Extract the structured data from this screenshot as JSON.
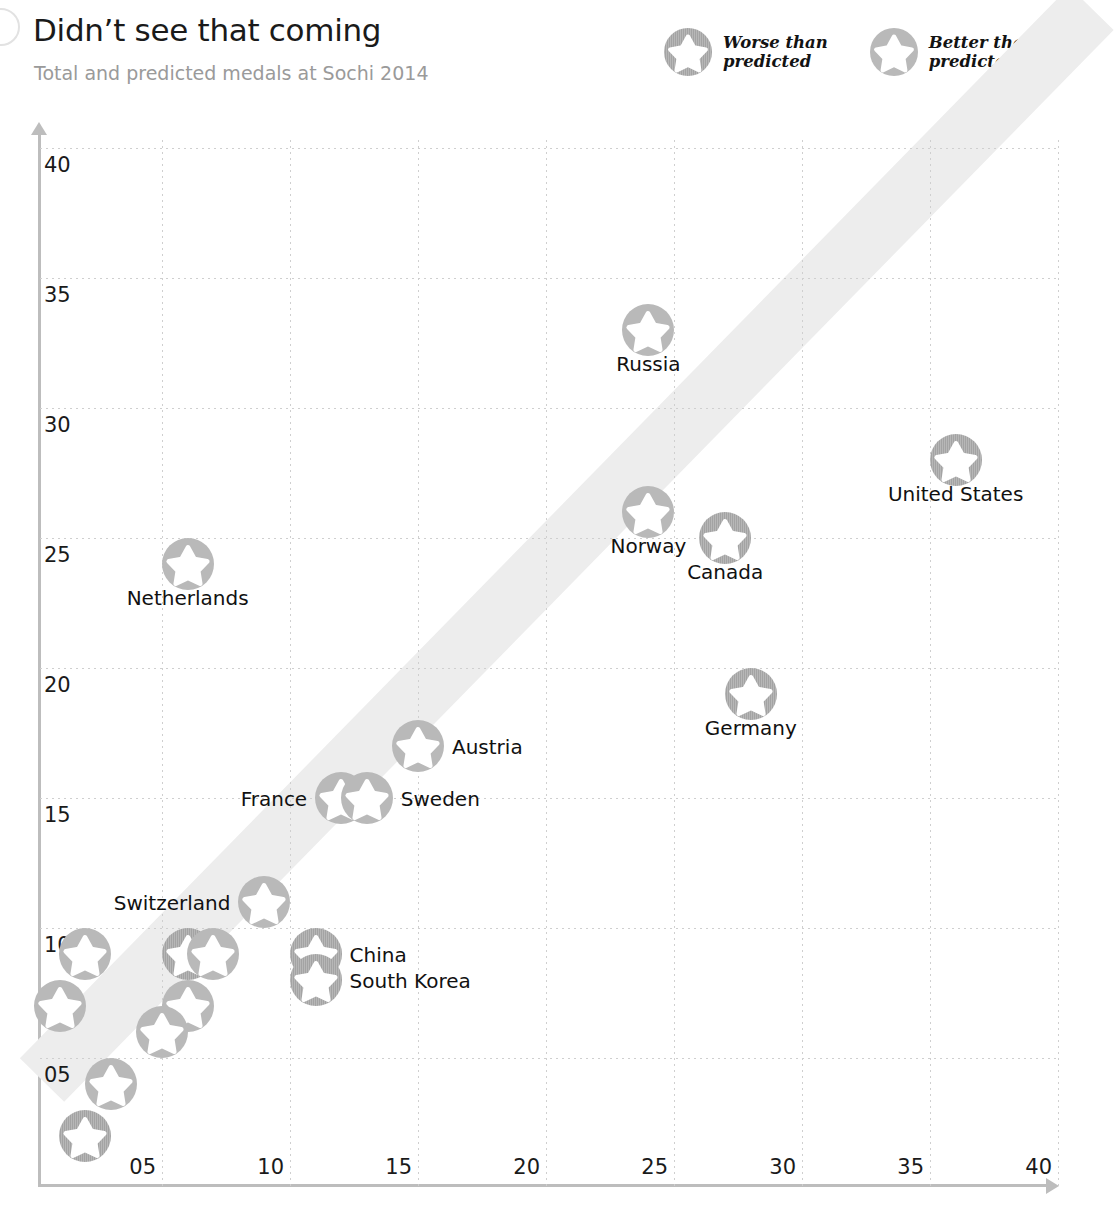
{
  "header": {
    "title": "Didn’t see that coming",
    "subtitle": "Total and predicted medals at Sochi 2014"
  },
  "legend": {
    "position": "top-right",
    "items": [
      {
        "label": "Worse than\npredicted",
        "style": "worse",
        "color": "#a3a3a3"
      },
      {
        "label": "Better than\npredicted",
        "style": "better",
        "color": "#b9b9b9"
      }
    ]
  },
  "colors": {
    "worse": "#a3a3a3",
    "better": "#b9b9b9",
    "band": "#ededed",
    "grid": "#cfcfcf",
    "axis": "#bdbdbd",
    "title": "#1a1a1a",
    "subtitle": "#9a9a9a"
  },
  "chart_data": {
    "type": "scatter",
    "title": "Didn’t see that coming",
    "subtitle": "Total and predicted medals at Sochi 2014",
    "xlabel": "",
    "ylabel": "",
    "xlim": [
      0,
      40
    ],
    "ylim": [
      0,
      41
    ],
    "grid": true,
    "xticks": [
      "05",
      "10",
      "15",
      "20",
      "25",
      "30",
      "35",
      "40"
    ],
    "xtick_values": [
      5,
      10,
      15,
      20,
      25,
      30,
      35,
      40
    ],
    "yticks": [
      "05",
      "10",
      "15",
      "20",
      "25",
      "30",
      "35",
      "40"
    ],
    "ytick_values": [
      5,
      10,
      15,
      20,
      25,
      30,
      35,
      40
    ],
    "parity_band": {
      "note": "diagonal equal-prediction band",
      "width_units": 2.4
    },
    "points": [
      {
        "label": "Russia",
        "x": 24,
        "y": 33,
        "group": "better",
        "label_pos": "below"
      },
      {
        "label": "United States",
        "x": 36,
        "y": 28,
        "group": "worse",
        "label_pos": "below"
      },
      {
        "label": "Norway",
        "x": 24,
        "y": 26,
        "group": "better",
        "label_pos": "below"
      },
      {
        "label": "Canada",
        "x": 27,
        "y": 25,
        "group": "worse",
        "label_pos": "below"
      },
      {
        "label": "Netherlands",
        "x": 6,
        "y": 24,
        "group": "better",
        "label_pos": "below"
      },
      {
        "label": "Germany",
        "x": 28,
        "y": 19,
        "group": "worse",
        "label_pos": "below"
      },
      {
        "label": "Austria",
        "x": 15,
        "y": 17,
        "group": "better",
        "label_pos": "right"
      },
      {
        "label": "France",
        "x": 12,
        "y": 15,
        "group": "better",
        "label_pos": "left"
      },
      {
        "label": "Sweden",
        "x": 13,
        "y": 15,
        "group": "better",
        "label_pos": "right"
      },
      {
        "label": "Switzerland",
        "x": 9,
        "y": 11,
        "group": "better",
        "label_pos": "left"
      },
      {
        "label": "China",
        "x": 11,
        "y": 9,
        "group": "worse",
        "label_pos": "right"
      },
      {
        "label": "South Korea",
        "x": 11,
        "y": 8,
        "group": "worse",
        "label_pos": "right"
      },
      {
        "label": "",
        "x": 2,
        "y": 9,
        "group": "better",
        "label_pos": "none"
      },
      {
        "label": "",
        "x": 6,
        "y": 9,
        "group": "worse",
        "label_pos": "none"
      },
      {
        "label": "",
        "x": 7,
        "y": 9,
        "group": "better",
        "label_pos": "none"
      },
      {
        "label": "",
        "x": 1,
        "y": 7,
        "group": "better",
        "label_pos": "none"
      },
      {
        "label": "",
        "x": 6,
        "y": 7,
        "group": "better",
        "label_pos": "none"
      },
      {
        "label": "",
        "x": 5,
        "y": 6,
        "group": "better",
        "label_pos": "none"
      },
      {
        "label": "",
        "x": 3,
        "y": 4,
        "group": "better",
        "label_pos": "none"
      },
      {
        "label": "",
        "x": 2,
        "y": 2,
        "group": "worse",
        "label_pos": "none"
      }
    ]
  }
}
